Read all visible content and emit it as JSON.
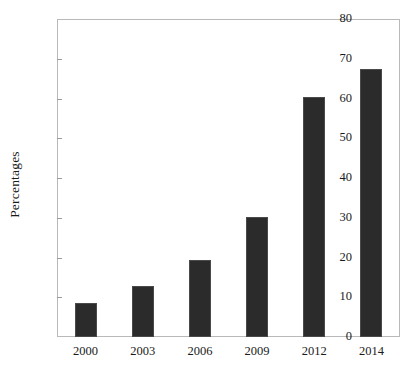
{
  "chart_data": {
    "type": "bar",
    "title": "",
    "xlabel": "",
    "ylabel": "Percentages",
    "categories": [
      "2000",
      "2003",
      "2006",
      "2009",
      "2012",
      "2014"
    ],
    "values": [
      8.5,
      12.8,
      19.3,
      30.2,
      60.3,
      67.5
    ],
    "ylim": [
      0,
      80
    ],
    "ytick_values": [
      0,
      10,
      20,
      30,
      40,
      50,
      60,
      70,
      80
    ],
    "ytick_labels": [
      "0",
      "10",
      "20",
      "30",
      "40",
      "50",
      "60",
      "70",
      "80"
    ],
    "grid": false,
    "legend": null,
    "bar_color": "#2b2b2b",
    "frame_color": "#b9b9b9",
    "background": "#ffffff"
  }
}
